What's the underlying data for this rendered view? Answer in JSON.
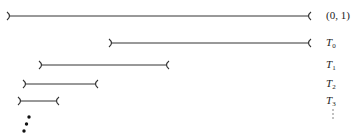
{
  "diagram": {
    "type": "nested-open-intervals",
    "stroke_color": "#333333",
    "intervals": [
      {
        "name": "unit-interval",
        "label": "(0, 1)",
        "label_base": "",
        "label_sub": "",
        "x1": 8,
        "x2": 310,
        "y": 16
      },
      {
        "name": "T0",
        "label": "",
        "label_base": "T",
        "label_sub": "0",
        "x1": 110,
        "x2": 310,
        "y": 43
      },
      {
        "name": "T1",
        "label": "",
        "label_base": "T",
        "label_sub": "1",
        "x1": 40,
        "x2": 168,
        "y": 65
      },
      {
        "name": "T2",
        "label": "",
        "label_base": "T",
        "label_sub": "2",
        "x1": 24,
        "x2": 97,
        "y": 84
      },
      {
        "name": "T3",
        "label": "",
        "label_base": "T",
        "label_sub": "3",
        "x1": 19,
        "x2": 58,
        "y": 101
      }
    ],
    "label_x": 326,
    "continuation_left": "diagonal-dots",
    "continuation_right": "vertical-ellipsis"
  }
}
